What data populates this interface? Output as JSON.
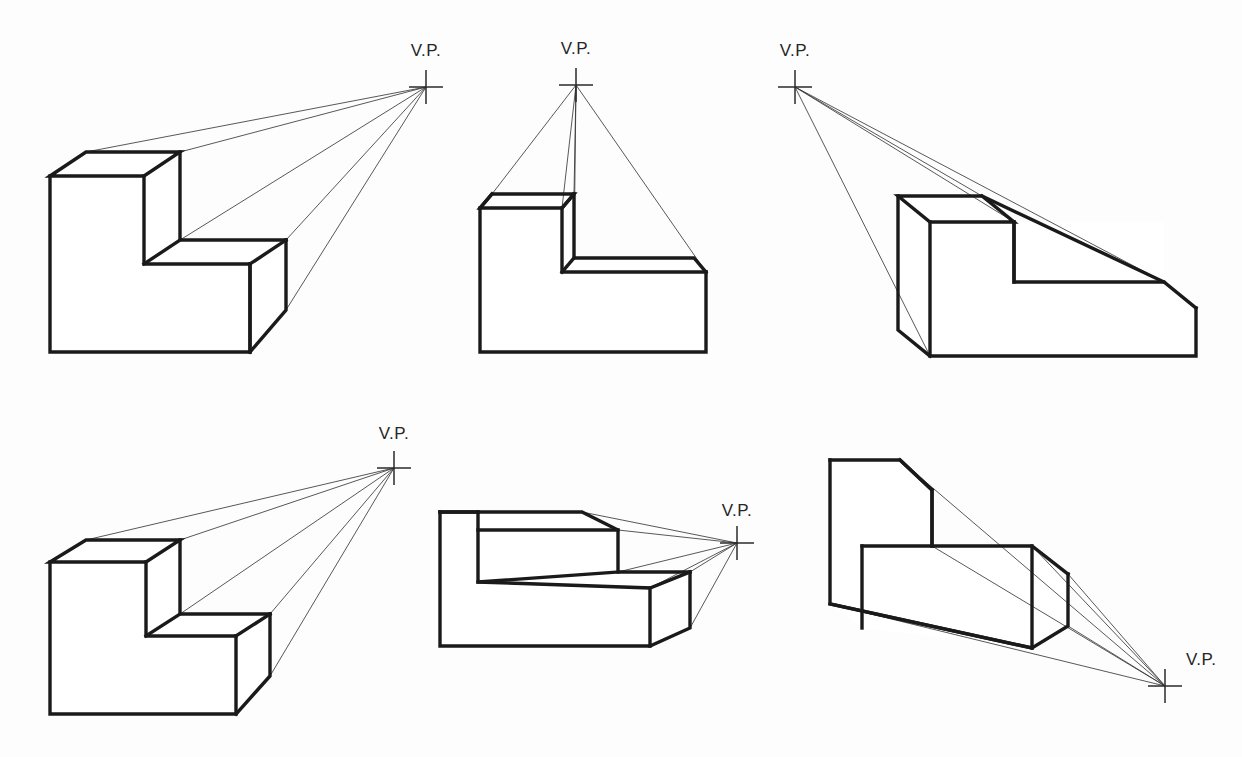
{
  "document": {
    "title": "One-Point Perspective Construction Examples",
    "background_color": "#fdfdfd",
    "line_color": "#1a1a1a",
    "projector_color": "#3a3a3a",
    "width": 1242,
    "height": 757
  },
  "vp_label_text": "V.P.",
  "figures": [
    {
      "id": "figure-1",
      "name": "vp-right-above-horizon",
      "label": "V.P.",
      "vp": {
        "x": 426,
        "y": 87
      },
      "label_pos": {
        "x": 426,
        "y": 56,
        "anchor": "middle"
      },
      "faces": [
        {
          "name": "top-upper",
          "points": "50,176 86,152 180,152 144,176"
        },
        {
          "name": "top-lower",
          "points": "144,264 180,240 286,240 250,264"
        },
        {
          "name": "right-upper",
          "points": "180,152 180,240 144,264 144,176"
        },
        {
          "name": "right-lower",
          "points": "286,240 286,310 250,352 250,264"
        },
        {
          "name": "front",
          "points": "50,176 144,176 144,264 250,264 250,352 50,352"
        }
      ],
      "edges": [
        "M50,176 L86,152 L180,152 L144,176 Z",
        "M180,152 L180,240 L286,240",
        "M144,176 L144,264 L250,264",
        "M286,240 L286,310 L250,352",
        "M250,264 L250,352 L50,352 L50,176",
        "M144,264 L180,240",
        "M250,264 L286,240",
        "M250,352 L250,264"
      ],
      "projectors": [
        "M86,152 L426,87",
        "M180,152 L426,87",
        "M180,240 L426,87",
        "M286,240 L426,87",
        "M286,310 L426,87"
      ],
      "smudges": []
    },
    {
      "id": "figure-2",
      "name": "vp-directly-above",
      "label": "V.P.",
      "vp": {
        "x": 576,
        "y": 85
      },
      "label_pos": {
        "x": 576,
        "y": 54,
        "anchor": "middle"
      },
      "faces": [
        {
          "name": "top-upper",
          "points": "480,208 492,194 574,194 562,208"
        },
        {
          "name": "top-lower",
          "points": "562,272 574,258 694,258 706,272"
        },
        {
          "name": "left-sliver",
          "points": "480,208 492,194 492,258 480,272"
        },
        {
          "name": "right-lower",
          "points": "694,258 706,272 706,352 694,352"
        },
        {
          "name": "front",
          "points": "480,208 562,208 562,272 706,272 706,352 480,352"
        }
      ],
      "edges": [
        "M480,208 L492,194 L574,194 L562,208 Z",
        "M562,208 L562,272 L706,272",
        "M574,194 L574,258 L694,258 L706,272",
        "M480,208 L480,352 L706,352 L706,272",
        "M562,272 L574,258",
        "M480,208 L492,194",
        "M562,208 L574,194"
      ],
      "projectors": [
        "M492,194 L576,85",
        "M574,194 L576,85",
        "M574,258 L576,85",
        "M562,208 L576,85",
        "M706,272 L576,85"
      ],
      "smudges": []
    },
    {
      "id": "figure-3",
      "name": "vp-upper-left",
      "label": "V.P.",
      "vp": {
        "x": 795,
        "y": 87
      },
      "label_pos": {
        "x": 795,
        "y": 56,
        "anchor": "middle"
      },
      "faces": [
        {
          "name": "top-upper",
          "points": "898,196 930,222 1014,222 982,196"
        },
        {
          "name": "top-lower",
          "points": "1014,282 1046,308 1196,308 1164,282"
        },
        {
          "name": "left",
          "points": "898,196 930,222 930,356 898,330"
        },
        {
          "name": "right-notch",
          "points": "1014,222 1014,282 1164,282 1164,222"
        },
        {
          "name": "front",
          "points": "930,222 1014,222 1014,282 1196,308 1196,356 930,356"
        }
      ],
      "edges": [
        "M898,196 L982,196 L1014,222 L930,222 Z",
        "M898,196 L898,330 L930,356",
        "M930,222 L930,356 L1196,356 L1196,308",
        "M1014,222 L1014,282 L1164,282 L1196,308",
        "M982,196 L1164,282",
        "M1014,222 L1014,282"
      ],
      "projectors": [
        "M795,87 L982,196",
        "M795,87 L1164,282",
        "M795,87 L930,356",
        "M795,87 L1014,222"
      ],
      "smudges": []
    },
    {
      "id": "figure-4",
      "name": "vp-right-high",
      "label": "V.P.",
      "vp": {
        "x": 394,
        "y": 468
      },
      "label_pos": {
        "x": 394,
        "y": 439,
        "anchor": "middle"
      },
      "faces": [
        {
          "name": "top-upper",
          "points": "50,562 86,540 180,540 146,562"
        },
        {
          "name": "top-lower",
          "points": "146,636 180,614 270,614 236,636"
        },
        {
          "name": "right-upper",
          "points": "180,540 180,614 146,636 146,562"
        },
        {
          "name": "right-lower",
          "points": "270,614 270,676 236,714 236,636"
        },
        {
          "name": "front",
          "points": "50,562 146,562 146,636 236,636 236,714 50,714"
        }
      ],
      "edges": [
        "M50,562 L86,540 L180,540 L146,562 Z",
        "M180,540 L180,614 L270,614",
        "M146,562 L146,636 L236,636",
        "M270,614 L270,676 L236,714",
        "M236,636 L236,714 L50,714 L50,562",
        "M146,636 L180,614",
        "M236,636 L270,614"
      ],
      "projectors": [
        "M86,540 L394,468",
        "M180,540 L394,468",
        "M180,614 L394,468",
        "M270,614 L394,468",
        "M270,676 L394,468"
      ],
      "smudges": []
    },
    {
      "id": "figure-5",
      "name": "vp-right-mid-horizon",
      "label": "V.P.",
      "vp": {
        "x": 737,
        "y": 543
      },
      "label_pos": {
        "x": 737,
        "y": 516,
        "anchor": "middle"
      },
      "faces": [
        {
          "name": "top-upper",
          "points": "440,512 582,512 618,530 478,530"
        },
        {
          "name": "top-lower",
          "points": "478,582 618,572 690,572 650,588"
        },
        {
          "name": "right-lower",
          "points": "690,572 690,628 650,646 650,588"
        },
        {
          "name": "front",
          "points": "440,512 478,512 478,582 650,588 650,646 440,646"
        },
        {
          "name": "left-inner",
          "points": "478,530 618,530 618,572 478,582"
        }
      ],
      "edges": [
        "M440,512 L582,512 L618,530 L618,572 L690,572",
        "M440,512 L440,646 L650,646 L690,628 L690,572",
        "M478,512 L478,582 L650,588 L650,646",
        "M478,530 L618,530",
        "M478,582 L618,572",
        "M440,512 L478,512",
        "M650,588 L690,572"
      ],
      "projectors": [
        "M582,512 L737,543",
        "M618,530 L737,543",
        "M618,572 L737,543",
        "M690,572 L737,543",
        "M690,628 L737,543",
        "M650,588 L737,543"
      ],
      "smudges": [
        {
          "points": "478,578 640,570 660,586 480,590"
        }
      ]
    },
    {
      "id": "figure-6",
      "name": "vp-lower-right",
      "label": "V.P.",
      "vp": {
        "x": 1165,
        "y": 686
      },
      "label_pos": {
        "x": 1186,
        "y": 665,
        "anchor": "start"
      },
      "faces": [
        {
          "name": "top-upper",
          "points": "830,460 900,460 932,490 932,546 862,546"
        },
        {
          "name": "top-lower",
          "points": "1032,546 1068,574 1068,626 1032,598"
        },
        {
          "name": "right-lower",
          "points": "1068,574 1068,626 1032,648 1032,598"
        },
        {
          "name": "front",
          "points": "830,460 900,460 932,490 932,546 1032,546 1032,598 1032,648 862,628 830,604"
        },
        {
          "name": "bottom-sliver",
          "points": "830,604 1032,648 862,628"
        }
      ],
      "edges": [
        "M830,460 L900,460 L932,490 L932,546",
        "M830,460 L830,604 L1032,648 L1068,626 L1068,574",
        "M862,546 L1032,546 L1068,574",
        "M862,546 L862,628",
        "M830,604 L1032,648",
        "M932,490 L932,546",
        "M1032,546 L1032,648",
        "M900,460 L932,490"
      ],
      "projectors": [
        "M900,460 L1165,686",
        "M932,546 L1165,686",
        "M1068,574 L1165,686",
        "M1068,626 L1165,686",
        "M830,604 L1165,686",
        "M1032,546 L1165,686"
      ],
      "smudges": []
    }
  ],
  "vp_cross": {
    "arm_length": 17,
    "stroke_width": 1.5
  }
}
